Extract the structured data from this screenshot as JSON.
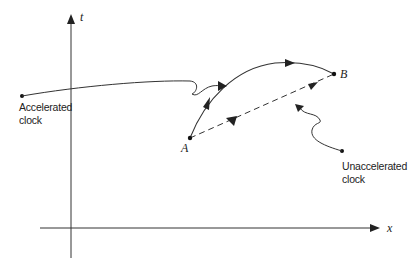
{
  "diagram": {
    "axes": {
      "vertical_label": "t",
      "horizontal_label": "x"
    },
    "points": {
      "a_label": "A",
      "b_label": "B"
    },
    "callouts": {
      "accelerated_line1": "Accelerated",
      "accelerated_line2": "clock",
      "unaccelerated_line1": "Unaccelerated",
      "unaccelerated_line2": "clock"
    },
    "paths": [
      {
        "name": "accelerated-worldline",
        "style": "solid curved",
        "from": "A",
        "to": "B"
      },
      {
        "name": "unaccelerated-worldline",
        "style": "dashed straight",
        "from": "A",
        "to": "B"
      }
    ],
    "colors": {
      "line": "#333333",
      "background": "#ffffff"
    }
  }
}
